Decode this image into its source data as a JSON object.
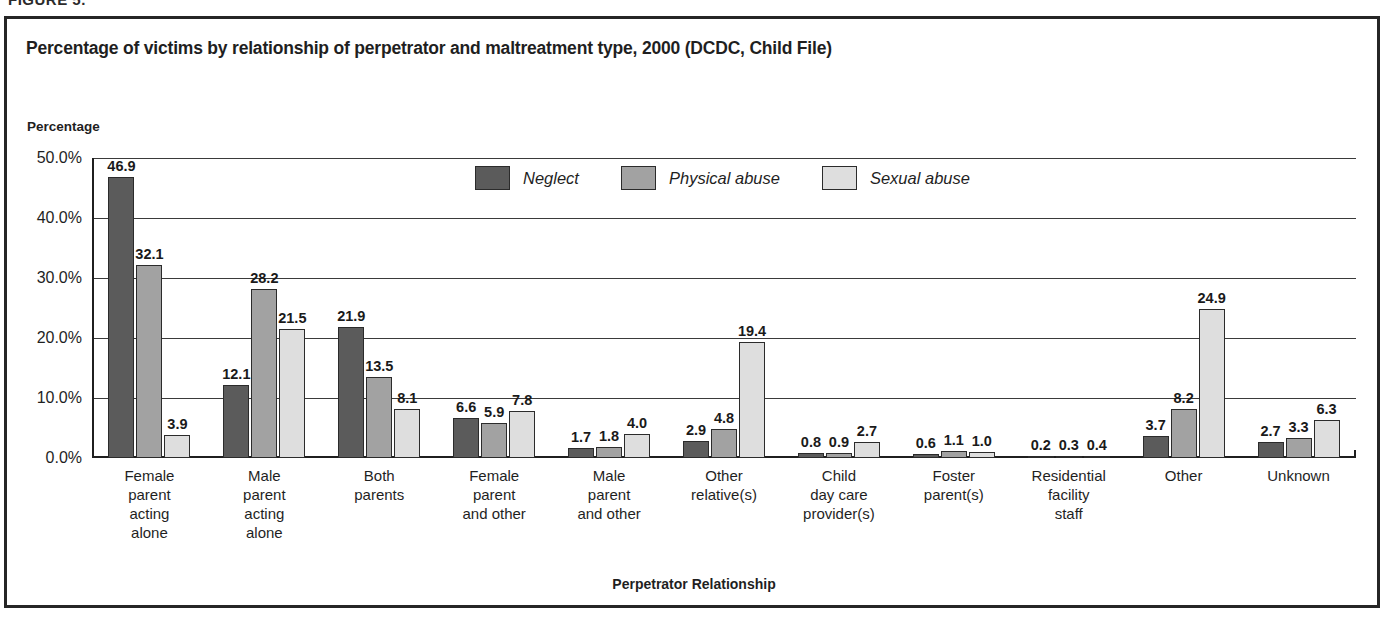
{
  "figure_caption": "FIGURE 5.",
  "chart_title": "Percentage of victims by relationship of perpetrator and maltreatment type, 2000 (DCDC, Child File)",
  "y_axis_title": "Percentage",
  "x_axis_title": "Perpetrator Relationship",
  "colors": {
    "neglect": "#5b5b5b",
    "physical_abuse": "#a2a2a2",
    "sexual_abuse": "#dedede",
    "frame": "#262626",
    "gridline": "#3a3a3a"
  },
  "chart_data": {
    "type": "bar",
    "title": "Percentage of victims by relationship of perpetrator and maltreatment type, 2000 (DCDC, Child File)",
    "xlabel": "Perpetrator Relationship",
    "ylabel": "Percentage",
    "ylim": [
      0,
      50
    ],
    "ytick_labels": [
      "0.0%",
      "10.0%",
      "20.0%",
      "30.0%",
      "40.0%",
      "50.0%"
    ],
    "ytick_values": [
      0,
      10,
      20,
      30,
      40,
      50
    ],
    "grid": true,
    "legend_position": "top-center",
    "categories": [
      "Female\nparent\nacting\nalone",
      "Male\nparent\nacting\nalone",
      "Both\nparents",
      "Female\nparent\nand other",
      "Male\nparent\nand other",
      "Other\nrelative(s)",
      "Child\nday care\nprovider(s)",
      "Foster\nparent(s)",
      "Residential\nfacility\nstaff",
      "Other",
      "Unknown"
    ],
    "series": [
      {
        "name": "Neglect",
        "values": [
          46.9,
          12.1,
          21.9,
          6.6,
          1.7,
          2.9,
          0.8,
          0.6,
          0.2,
          3.7,
          2.7
        ]
      },
      {
        "name": "Physical abuse",
        "values": [
          32.1,
          28.2,
          13.5,
          5.9,
          1.8,
          4.8,
          0.9,
          1.1,
          0.3,
          8.2,
          3.3
        ]
      },
      {
        "name": "Sexual abuse",
        "values": [
          3.9,
          21.5,
          8.1,
          7.8,
          4.0,
          19.4,
          2.7,
          1.0,
          0.4,
          24.9,
          6.3
        ]
      }
    ]
  }
}
